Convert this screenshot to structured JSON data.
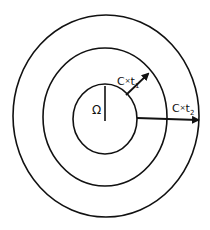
{
  "diagram": {
    "source_label": "Ω",
    "arrow1": {
      "base": "C",
      "op": "×",
      "var": "t",
      "sub": "1"
    },
    "arrow2": {
      "base": "C",
      "op": "×",
      "var": "t",
      "sub": "2"
    },
    "stroke_color": "#111111",
    "background": "#ffffff"
  }
}
